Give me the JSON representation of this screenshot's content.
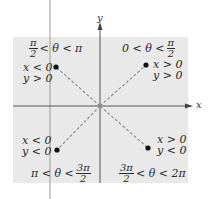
{
  "diagram": {
    "axes": {
      "x_label": "x",
      "y_label": "y"
    },
    "quadrants": [
      {
        "id": "quadrant-1",
        "range": {
          "left": "0 < θ <",
          "frac_num": "π",
          "frac_den": "2",
          "right": ""
        },
        "conditions": [
          "x > 0",
          "y > 0"
        ]
      },
      {
        "id": "quadrant-2",
        "range": {
          "left": "",
          "frac_num": "π",
          "frac_den": "2",
          "right": "< θ < π"
        },
        "conditions": [
          "x < 0",
          "y > 0"
        ]
      },
      {
        "id": "quadrant-3",
        "range": {
          "left": "π < θ <",
          "frac_num": "3π",
          "frac_den": "2",
          "right": ""
        },
        "conditions": [
          "x < 0",
          "y < 0"
        ]
      },
      {
        "id": "quadrant-4",
        "range": {
          "left": "",
          "frac_num": "3π",
          "frac_den": "2",
          "right": "< θ < 2π"
        },
        "conditions": [
          "x > 0",
          "y < 0"
        ]
      }
    ],
    "colors": {
      "panel": "#e9e9e9",
      "axis": "#555555",
      "dash": "#8a8a8a",
      "dot": "#111111"
    }
  }
}
